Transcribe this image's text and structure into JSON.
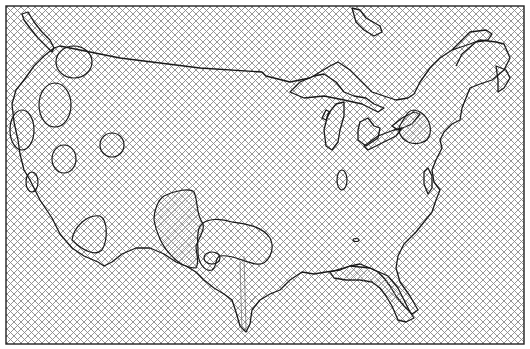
{
  "map": {
    "subject": "Contiguous United States with contour overlay",
    "style": "crosshatch fill with closed contour regions",
    "colors": {
      "background": "#ffffff",
      "hatch": "#8a8a8a",
      "outline": "#1a1a1a",
      "frame": "#222222"
    },
    "frame": {
      "x": 6,
      "y": 6,
      "width": 518,
      "height": 338
    },
    "regions": [
      {
        "name": "puget-sound",
        "type": "coastline"
      },
      {
        "name": "great-lakes",
        "type": "coastline"
      },
      {
        "name": "florida",
        "type": "coastline"
      },
      {
        "name": "texas-gulf",
        "type": "coastline"
      },
      {
        "name": "washington-contour",
        "type": "contour"
      },
      {
        "name": "oregon-contour",
        "type": "contour"
      },
      {
        "name": "idaho-contour",
        "type": "contour"
      },
      {
        "name": "nevada-contour",
        "type": "contour"
      },
      {
        "name": "california-north-contour",
        "type": "contour"
      },
      {
        "name": "california-south-contour",
        "type": "contour"
      },
      {
        "name": "texas-panhandle-contour",
        "type": "contour"
      },
      {
        "name": "oklahoma-contour",
        "type": "contour"
      },
      {
        "name": "midwest-small-contour",
        "type": "contour"
      },
      {
        "name": "lake-ontario-contour",
        "type": "contour"
      }
    ]
  }
}
